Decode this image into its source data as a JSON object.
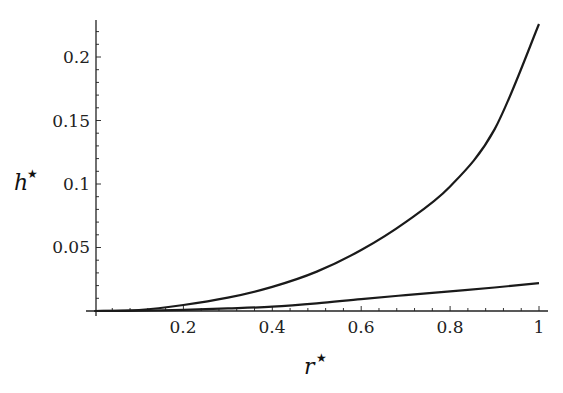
{
  "chart_data": {
    "type": "line",
    "title": "",
    "xlabel": "r*",
    "ylabel": "h*",
    "xlim": [
      0,
      1
    ],
    "ylim": [
      0,
      0.23
    ],
    "grid": false,
    "legend": null,
    "x_ticks": [
      "0.2",
      "0.4",
      "0.6",
      "0.8",
      "1"
    ],
    "y_ticks": [
      "0.05",
      "0.1",
      "0.15",
      "0.2"
    ],
    "x": [
      0,
      0.1,
      0.2,
      0.3,
      0.4,
      0.5,
      0.6,
      0.7,
      0.8,
      0.9,
      1.0
    ],
    "series": [
      {
        "name": "upper curve",
        "values": [
          0,
          0.0008,
          0.0047,
          0.0105,
          0.019,
          0.031,
          0.048,
          0.07,
          0.098,
          0.143,
          0.226
        ]
      },
      {
        "name": "lower curve",
        "values": [
          0,
          0.0002,
          0.0009,
          0.002,
          0.0034,
          0.006,
          0.0094,
          0.0125,
          0.0155,
          0.0185,
          0.022
        ]
      }
    ]
  },
  "labels": {
    "x_axis_var": "r",
    "y_axis_var": "h",
    "star": "★"
  }
}
